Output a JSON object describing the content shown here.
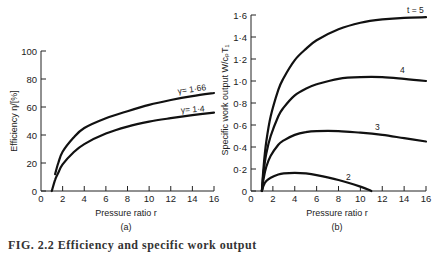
{
  "caption": "FIG. 2.2 Efficiency and specific work output",
  "chart_data": [
    {
      "type": "line",
      "panel": "(a)",
      "title": "",
      "xlabel": "Pressure ratio r",
      "ylabel": "Efficiency η/[%]",
      "xlim": [
        0,
        16
      ],
      "ylim": [
        0,
        100
      ],
      "xticks": [
        0,
        2,
        4,
        6,
        8,
        10,
        12,
        14,
        16
      ],
      "yticks": [
        0,
        20,
        40,
        60,
        80,
        100
      ],
      "grid": false,
      "series": [
        {
          "name": "γ= 1·66",
          "x": [
            1.3,
            1.6,
            2,
            3,
            4,
            6,
            8,
            10,
            12,
            14,
            16
          ],
          "y": [
            12,
            20,
            28,
            38,
            45,
            52,
            57,
            61.5,
            65,
            67.8,
            70
          ]
        },
        {
          "name": "γ= 1·4",
          "x": [
            1,
            1.3,
            1.6,
            2,
            3,
            4,
            6,
            8,
            10,
            12,
            14,
            16
          ],
          "y": [
            0,
            8,
            13,
            19,
            27.5,
            33.5,
            41,
            46,
            49.5,
            52,
            54.2,
            56
          ]
        }
      ]
    },
    {
      "type": "line",
      "panel": "(b)",
      "title": "",
      "xlabel": "Pressure ratio r",
      "ylabel": "Specific work output W/cₚT₁",
      "xlim": [
        0,
        16
      ],
      "ylim": [
        0,
        1.6
      ],
      "xticks": [
        0,
        2,
        4,
        6,
        8,
        10,
        12,
        14,
        16
      ],
      "yticks": [
        0,
        0.2,
        0.4,
        0.6,
        0.8,
        1.0,
        1.2,
        1.4,
        1.6
      ],
      "ytick_labels": [
        "0",
        "0·2",
        "0·4",
        "0·6",
        "0·8",
        "1·0",
        "1·2",
        "1·4",
        "1·6"
      ],
      "grid": false,
      "series": [
        {
          "name": "t = 5",
          "x": [
            1,
            1.15,
            1.4,
            1.8,
            2.5,
            3,
            4,
            5,
            6,
            8,
            10,
            12,
            14,
            16
          ],
          "y": [
            0,
            0.22,
            0.45,
            0.68,
            0.92,
            1.03,
            1.19,
            1.29,
            1.37,
            1.47,
            1.53,
            1.56,
            1.575,
            1.58
          ]
        },
        {
          "name": "4",
          "x": [
            1,
            1.15,
            1.4,
            1.8,
            2.5,
            3,
            4,
            5,
            6,
            8,
            10,
            12,
            14,
            16
          ],
          "y": [
            0,
            0.17,
            0.34,
            0.5,
            0.68,
            0.76,
            0.87,
            0.93,
            0.97,
            1.02,
            1.035,
            1.035,
            1.02,
            1.0
          ]
        },
        {
          "name": "3",
          "x": [
            1,
            1.15,
            1.4,
            1.8,
            2.5,
            3,
            4,
            5,
            6,
            8,
            10,
            12,
            14,
            16
          ],
          "y": [
            0,
            0.11,
            0.22,
            0.32,
            0.42,
            0.46,
            0.51,
            0.535,
            0.545,
            0.545,
            0.53,
            0.51,
            0.48,
            0.45
          ]
        },
        {
          "name": "2",
          "x": [
            1,
            1.15,
            1.4,
            1.8,
            2.5,
            3,
            4,
            5,
            6,
            8,
            10,
            11
          ],
          "y": [
            0,
            0.05,
            0.09,
            0.12,
            0.15,
            0.16,
            0.165,
            0.16,
            0.145,
            0.1,
            0.04,
            0
          ]
        }
      ]
    }
  ],
  "labels": {
    "a": {
      "panel": "(a)",
      "xlabel": "Pressure ratio r",
      "ylabel": "Efficiency η/[%]",
      "series_1": "γ= 1·66",
      "series_2": "γ= 1·4"
    },
    "b": {
      "panel": "(b)",
      "xlabel": "Pressure ratio r",
      "ylabel": "Specific work output W/cₚT₁",
      "series_t5": "t = 5",
      "series_t4": "4",
      "series_t3": "3",
      "series_t2": "2"
    }
  }
}
